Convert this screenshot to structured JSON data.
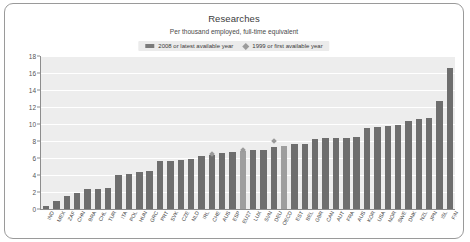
{
  "card": {
    "title": "Researches",
    "subtitle": "Per thousand employed, full-time equivalent"
  },
  "legend": {
    "position": "top-center",
    "items": [
      {
        "label": "2008 or latest available year",
        "marker": "bar",
        "color": "#7a7a7a"
      },
      {
        "label": "1999 or first available year",
        "marker": "diamond",
        "color": "#9b9b9b"
      }
    ]
  },
  "chart_data": {
    "type": "bar",
    "title": "Researches",
    "subtitle": "Per thousand employed, full-time equivalent",
    "xlabel": "",
    "ylabel": "",
    "ylim": [
      0,
      18
    ],
    "yticks": [
      0,
      2,
      4,
      6,
      8,
      10,
      12,
      14,
      16,
      18
    ],
    "grid": true,
    "categories": [
      "IND",
      "MEX",
      "ZAF",
      "CHN",
      "BRA",
      "CHL",
      "TUR",
      "ITA",
      "POL",
      "HUN",
      "GRC",
      "PRT",
      "SVK",
      "CZE",
      "NLD",
      "IRL",
      "CHE",
      "AUS",
      "ESP",
      "EU27",
      "LUX",
      "SVN",
      "DEU",
      "OECD",
      "EST",
      "BEL",
      "GBR",
      "CAN",
      "AUT",
      "FRA",
      "AUS",
      "KOR",
      "USA",
      "NOR",
      "SWE",
      "DNK",
      "NZL",
      "JPN",
      "ISL",
      "FIN"
    ],
    "series": [
      {
        "name": "2008 or latest available year",
        "type": "bar",
        "color": "#6e6e6e",
        "values": [
          0.4,
          1.0,
          1.5,
          1.9,
          2.3,
          2.4,
          2.5,
          4.0,
          4.1,
          4.3,
          4.5,
          5.6,
          5.7,
          5.8,
          5.9,
          6.2,
          6.4,
          6.6,
          6.7,
          6.8,
          6.9,
          7.0,
          7.3,
          7.4,
          7.6,
          7.7,
          8.2,
          8.3,
          8.4,
          8.4,
          8.5,
          9.5,
          9.6,
          9.8,
          9.9,
          10.4,
          10.6,
          10.7,
          12.7,
          16.6
        ]
      },
      {
        "name": "1999 or first available year",
        "type": "scatter",
        "marker": "diamond",
        "color": "#9a9a9a",
        "values": [
          null,
          null,
          null,
          null,
          null,
          null,
          null,
          null,
          null,
          null,
          null,
          null,
          null,
          null,
          null,
          null,
          6.5,
          null,
          null,
          7.0,
          null,
          null,
          8.0,
          null,
          null,
          null,
          null,
          null,
          null,
          null,
          null,
          null,
          null,
          null,
          null,
          null,
          null,
          null,
          null,
          null
        ]
      }
    ],
    "highlight_bars": [
      "OECD",
      "EU27"
    ]
  }
}
